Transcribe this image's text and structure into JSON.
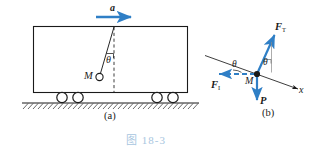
{
  "figure": {
    "caption": "图 18-3",
    "caption_color": "#a8c6e0",
    "accent_color": "#2f7fc6",
    "line_color": "#1a1a1a",
    "background": "#ffffff"
  },
  "panel_a": {
    "tag": "(a)",
    "acceleration_label": "a",
    "angle_label": "θ",
    "mass_label": "M",
    "description": "Cart on wheels accelerating right with a pendulum bob M hanging at angle theta from the vertical dashed line",
    "wheel_count": 4
  },
  "panel_b": {
    "tag": "(b)",
    "mass_label": "M",
    "angle_label": "θ",
    "axis_label": "x",
    "forces": [
      {
        "name": "tension",
        "label": "F",
        "subscript": "T",
        "direction": "up-right",
        "color": "#2f7fc6"
      },
      {
        "name": "inertial",
        "label": "F",
        "subscript": "I",
        "direction": "left",
        "color": "#2f7fc6",
        "style": "dashed"
      },
      {
        "name": "weight",
        "label": "P",
        "subscript": "",
        "direction": "down",
        "color": "#2f7fc6"
      }
    ],
    "description": "Free body diagram of the bob showing tension F_T, inertial force F_I and weight P with angle theta to the inclined axis"
  }
}
